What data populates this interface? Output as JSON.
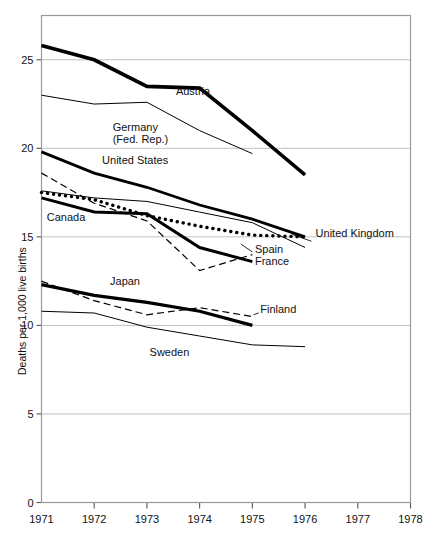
{
  "title_partial": "",
  "chart_data": {
    "type": "line",
    "title": "",
    "xlabel": "",
    "ylabel": "Deaths per 1,000 live births",
    "xlim": [
      1971,
      1978
    ],
    "ylim": [
      0,
      27.5
    ],
    "xticks": [
      "1971",
      "1972",
      "1973",
      "1974",
      "1975",
      "1976",
      "1977",
      "1978"
    ],
    "yticks": [
      "0",
      "5",
      "10",
      "15",
      "20",
      "25"
    ],
    "grid": "horizontal",
    "legend": "inline-annotations",
    "series": [
      {
        "name": "Austria",
        "style": "thick-solid",
        "width": 3.6,
        "x": [
          1971,
          1972,
          1973,
          1974,
          1975,
          1976
        ],
        "values": [
          25.8,
          25.0,
          23.5,
          23.4,
          21.0,
          18.5
        ],
        "label": "Austria",
        "label_x": 1973.55,
        "label_y": 23.0
      },
      {
        "name": "Germany (Fed. Rep.)",
        "style": "thin-solid",
        "width": 1.0,
        "x": [
          1971,
          1972,
          1973,
          1974,
          1975
        ],
        "values": [
          23.0,
          22.5,
          22.6,
          21.0,
          19.7
        ],
        "label": "Germany\n(Fed. Rep.)",
        "label_x": 1972.35,
        "label_y": 21.0
      },
      {
        "name": "United States",
        "style": "thick-solid",
        "width": 2.8,
        "x": [
          1971,
          1972,
          1973,
          1974,
          1975,
          1976
        ],
        "values": [
          19.8,
          18.6,
          17.8,
          16.8,
          16.0,
          15.0
        ],
        "label": "United States",
        "label_x": 1972.15,
        "label_y": 19.1
      },
      {
        "name": "United Kingdom",
        "style": "thin-solid",
        "width": 1.0,
        "x": [
          1971,
          1972,
          1973,
          1974,
          1975,
          1976
        ],
        "values": [
          17.6,
          17.2,
          17.0,
          16.4,
          15.8,
          14.4
        ],
        "label": "United Kingdom",
        "label_x": 1976.2,
        "label_y": 15.0
      },
      {
        "name": "Canada",
        "style": "thick-dotted",
        "width": 3.4,
        "x": [
          1971,
          1972,
          1973,
          1974,
          1975,
          1976
        ],
        "values": [
          17.5,
          17.1,
          16.2,
          15.6,
          15.1,
          15.0
        ],
        "label": "Canada",
        "label_x": 1971.1,
        "label_y": 15.9
      },
      {
        "name": "France",
        "style": "thick-solid",
        "width": 3.0,
        "x": [
          1971,
          1972,
          1973,
          1974,
          1975
        ],
        "values": [
          17.2,
          16.4,
          16.3,
          14.4,
          13.6
        ],
        "label": "France",
        "label_x": 1975.05,
        "label_y": 13.4
      },
      {
        "name": "Spain",
        "style": "dashed",
        "width": 1.2,
        "x": [
          1971,
          1972,
          1973,
          1974,
          1975
        ],
        "values": [
          18.6,
          16.9,
          15.9,
          13.1,
          14.0
        ],
        "label": "Spain",
        "label_x": 1975.05,
        "label_y": 14.1
      },
      {
        "name": "Japan",
        "style": "thick-solid",
        "width": 3.2,
        "x": [
          1971,
          1972,
          1973,
          1974,
          1975
        ],
        "values": [
          12.3,
          11.7,
          11.3,
          10.8,
          10.0
        ],
        "label": "Japan",
        "label_x": 1972.3,
        "label_y": 12.3
      },
      {
        "name": "Finland",
        "style": "dashed",
        "width": 1.2,
        "x": [
          1971,
          1972,
          1973,
          1974,
          1975
        ],
        "values": [
          12.5,
          11.4,
          10.6,
          11.0,
          10.5
        ],
        "label": "Finland",
        "label_x": 1975.15,
        "label_y": 10.7
      },
      {
        "name": "Sweden",
        "style": "thin-solid",
        "width": 1.0,
        "x": [
          1971,
          1972,
          1973,
          1974,
          1975,
          1976
        ],
        "values": [
          10.8,
          10.7,
          9.9,
          9.4,
          8.9,
          8.8
        ],
        "label": "Sweden",
        "label_x": 1973.05,
        "label_y": 8.3
      }
    ],
    "leader_lines": [
      {
        "name": "united-kingdom-leader",
        "x1": 1975.75,
        "y1": 15.15,
        "x2": 1976.12,
        "y2": 14.75
      },
      {
        "name": "spain-leader",
        "x1": 1974.78,
        "y1": 14.6,
        "x2": 1975.0,
        "y2": 14.15
      },
      {
        "name": "finland-leader",
        "x1": 1975.02,
        "y1": 10.6,
        "x2": 1975.12,
        "y2": 10.7
      }
    ]
  }
}
